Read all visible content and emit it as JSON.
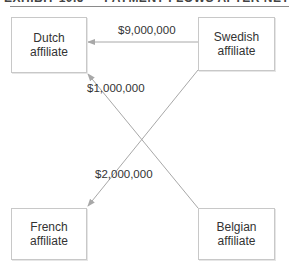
{
  "header": {
    "title": "EXHIBIT 10.5 — PAYMENT FLOWS AFTER NETTING"
  },
  "nodes": [
    {
      "id": "dutch",
      "line1": "Dutch",
      "line2": "affiliate"
    },
    {
      "id": "swedish",
      "line1": "Swedish",
      "line2": "affiliate"
    },
    {
      "id": "french",
      "line1": "French",
      "line2": "affiliate"
    },
    {
      "id": "belgian",
      "line1": "Belgian",
      "line2": "affiliate"
    }
  ],
  "flows": [
    {
      "from": "swedish",
      "to": "dutch",
      "amount": "$9,000,000"
    },
    {
      "from": "belgian",
      "to": "dutch",
      "amount": "$1,000,000"
    },
    {
      "from": "swedish",
      "to": "french",
      "amount": "$2,000,000"
    }
  ],
  "colors": {
    "line": "#a8a8a8",
    "box_border": "#c8c8c8",
    "text": "#333333"
  }
}
